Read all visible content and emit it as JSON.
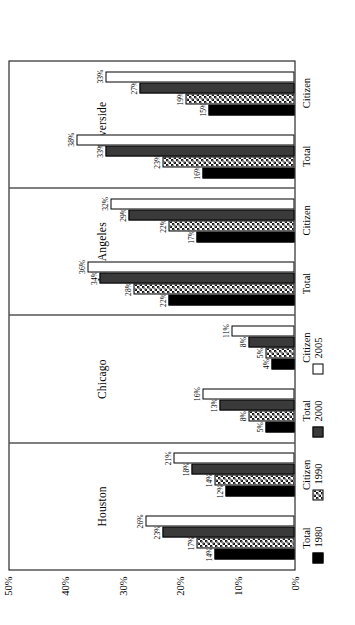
{
  "chart_data": {
    "type": "bar",
    "orientation": "horizontal",
    "title": "",
    "xlabel": "",
    "ylabel": "",
    "ylim": [
      0,
      50
    ],
    "ytick_labels": [
      "0%",
      "10%",
      "20%",
      "30%",
      "40%",
      "50%"
    ],
    "ytick_values": [
      0,
      10,
      20,
      30,
      40,
      50
    ],
    "grid": false,
    "legend_position": "bottom-left",
    "value_suffix": "%",
    "series": [
      {
        "name": "1980",
        "fill": "solid-black",
        "color": "#000000"
      },
      {
        "name": "1990",
        "fill": "crosshatch",
        "color": "#1a1a1a"
      },
      {
        "name": "2000",
        "fill": "solid-darkgray",
        "color": "#3a3a3a"
      },
      {
        "name": "2005",
        "fill": "empty-white",
        "color": "#ffffff"
      }
    ],
    "panels": [
      {
        "name": "Houston",
        "groups": [
          {
            "name": "Total",
            "bars": [
              {
                "series": "1980",
                "value": 14,
                "label": "14%"
              },
              {
                "series": "1990",
                "value": 17,
                "label": "17%"
              },
              {
                "series": "2000",
                "value": 23,
                "label": "23%"
              },
              {
                "series": "2005",
                "value": 26,
                "label": "26%"
              }
            ]
          },
          {
            "name": "Citizen",
            "bars": [
              {
                "series": "1980",
                "value": 12,
                "label": "12%"
              },
              {
                "series": "1990",
                "value": 14,
                "label": "14%"
              },
              {
                "series": "2000",
                "value": 18,
                "label": "18%"
              },
              {
                "series": "2005",
                "value": 21,
                "label": "21%"
              }
            ]
          }
        ]
      },
      {
        "name": "Chicago",
        "groups": [
          {
            "name": "Total",
            "bars": [
              {
                "series": "1980",
                "value": 5,
                "label": "5%"
              },
              {
                "series": "1990",
                "value": 8,
                "label": "8%"
              },
              {
                "series": "2000",
                "value": 13,
                "label": "13%"
              },
              {
                "series": "2005",
                "value": 16,
                "label": "16%"
              }
            ]
          },
          {
            "name": "Citizen",
            "bars": [
              {
                "series": "1980",
                "value": 4,
                "label": "4%"
              },
              {
                "series": "1990",
                "value": 5,
                "label": "5%"
              },
              {
                "series": "2000",
                "value": 8,
                "label": "8%"
              },
              {
                "series": "2005",
                "value": 11,
                "label": "11%"
              }
            ]
          }
        ]
      },
      {
        "name": "Los Angeles",
        "groups": [
          {
            "name": "Total",
            "bars": [
              {
                "series": "1980",
                "value": 22,
                "label": "22%"
              },
              {
                "series": "1990",
                "value": 28,
                "label": "28%"
              },
              {
                "series": "2000",
                "value": 34,
                "label": "34%"
              },
              {
                "series": "2005",
                "value": 36,
                "label": "36%"
              }
            ]
          },
          {
            "name": "Citizen",
            "bars": [
              {
                "series": "1980",
                "value": 17,
                "label": "17%"
              },
              {
                "series": "1990",
                "value": 22,
                "label": "22%"
              },
              {
                "series": "2000",
                "value": 29,
                "label": "29%"
              },
              {
                "series": "2005",
                "value": 32,
                "label": "32%"
              }
            ]
          }
        ]
      },
      {
        "name": "Riverside",
        "groups": [
          {
            "name": "Total",
            "bars": [
              {
                "series": "1980",
                "value": 16,
                "label": "16%"
              },
              {
                "series": "1990",
                "value": 23,
                "label": "23%"
              },
              {
                "series": "2000",
                "value": 33,
                "label": "33%"
              },
              {
                "series": "2005",
                "value": 38,
                "label": "38%"
              }
            ]
          },
          {
            "name": "Citizen",
            "bars": [
              {
                "series": "1980",
                "value": 15,
                "label": "15%"
              },
              {
                "series": "1990",
                "value": 19,
                "label": "19%"
              },
              {
                "series": "2000",
                "value": 27,
                "label": "27%"
              },
              {
                "series": "2005",
                "value": 33,
                "label": "33%"
              }
            ]
          }
        ]
      }
    ],
    "legend": [
      {
        "label": "1980"
      },
      {
        "label": "1990"
      },
      {
        "label": "2000"
      },
      {
        "label": "2005"
      }
    ]
  }
}
